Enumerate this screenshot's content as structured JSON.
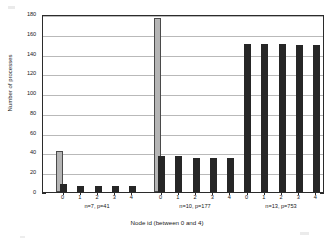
{
  "chart_data": {
    "type": "bar",
    "title": "",
    "xlabel": "Node id (between 0 and 4)",
    "ylabel": "Number of processes",
    "ylim": [
      0,
      180
    ],
    "yticks": [
      0,
      20,
      40,
      60,
      80,
      100,
      120,
      140,
      160,
      180
    ],
    "grid": true,
    "legend": "none",
    "categories": [
      "0",
      "1",
      "2",
      "3",
      "4"
    ],
    "groups": [
      {
        "label": "n=7, p=41",
        "n": 7,
        "p": 41,
        "bars": [
          {
            "x": "0",
            "value": 41,
            "color": "#b5b5b5",
            "style": "gray"
          },
          {
            "x": "0",
            "value": 8,
            "color": "#262626",
            "style": "black"
          },
          {
            "x": "1",
            "value": 6,
            "color": "#262626",
            "style": "black"
          },
          {
            "x": "2",
            "value": 6,
            "color": "#262626",
            "style": "black"
          },
          {
            "x": "3",
            "value": 6,
            "color": "#262626",
            "style": "black"
          },
          {
            "x": "4",
            "value": 6,
            "color": "#262626",
            "style": "black"
          }
        ]
      },
      {
        "label": "n=10, p=177",
        "n": 10,
        "p": 177,
        "bars": [
          {
            "x": "0",
            "value": 176,
            "color": "#b5b5b5",
            "style": "gray"
          },
          {
            "x": "0",
            "value": 36,
            "color": "#262626",
            "style": "black"
          },
          {
            "x": "1",
            "value": 36,
            "color": "#262626",
            "style": "black"
          },
          {
            "x": "2",
            "value": 34,
            "color": "#262626",
            "style": "black"
          },
          {
            "x": "3",
            "value": 34,
            "color": "#262626",
            "style": "black"
          },
          {
            "x": "4",
            "value": 34,
            "color": "#262626",
            "style": "black"
          }
        ]
      },
      {
        "label": "n=13, p=753",
        "n": 13,
        "p": 753,
        "bars": [
          {
            "x": "0",
            "value": 150,
            "color": "#262626",
            "style": "black"
          },
          {
            "x": "1",
            "value": 150,
            "color": "#262626",
            "style": "black"
          },
          {
            "x": "2",
            "value": 150,
            "color": "#262626",
            "style": "black"
          },
          {
            "x": "3",
            "value": 149,
            "color": "#262626",
            "style": "black"
          },
          {
            "x": "4",
            "value": 149,
            "color": "#262626",
            "style": "black"
          }
        ]
      }
    ],
    "colors": {
      "bar_dark": "#262626",
      "bar_light": "#b5b5b5",
      "grid": "#b9b9b9",
      "axis": "#2b2b2b",
      "background": "#ffffff"
    }
  }
}
